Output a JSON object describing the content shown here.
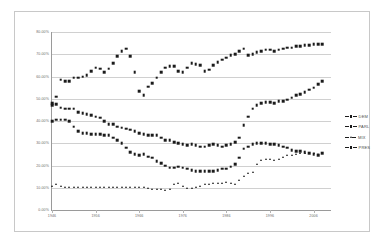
{
  "chart_data": {
    "type": "scatter",
    "title": "",
    "xlabel": "",
    "ylabel": "",
    "grid": true,
    "legend_position": "right",
    "xlim": [
      1946,
      2010
    ],
    "ylim": [
      0,
      80
    ],
    "ytick_labels": [
      "80.00%",
      "70.00%",
      "60.00%",
      "50.00%",
      "40.00%",
      "30.00%",
      "20.00%",
      "10.00%",
      "0.00%"
    ],
    "ytick_values": [
      80,
      70,
      60,
      50,
      40,
      30,
      20,
      10,
      0
    ],
    "xtick_labels": [
      "1946",
      "1956",
      "1966",
      "1976",
      "1986",
      "1996",
      "2006"
    ],
    "xtick_values": [
      1946,
      1956,
      1966,
      1976,
      1986,
      1996,
      2006
    ],
    "x": [
      1946,
      1947,
      1948,
      1949,
      1950,
      1951,
      1952,
      1953,
      1954,
      1955,
      1956,
      1957,
      1958,
      1959,
      1960,
      1961,
      1962,
      1963,
      1964,
      1965,
      1966,
      1967,
      1968,
      1969,
      1970,
      1971,
      1972,
      1973,
      1974,
      1975,
      1976,
      1977,
      1978,
      1979,
      1980,
      1981,
      1982,
      1983,
      1984,
      1985,
      1986,
      1987,
      1988,
      1989,
      1990,
      1991,
      1992,
      1993,
      1994,
      1995,
      1996,
      1997,
      1998,
      1999,
      2000,
      2001,
      2002,
      2003,
      2004,
      2005,
      2006,
      2007,
      2008
    ],
    "series": [
      {
        "name": "DEM",
        "marker": "square",
        "color": "#1b1b1b",
        "values": [
          48.0,
          51.0,
          58.5,
          58.0,
          58.0,
          59.5,
          59.5,
          60.0,
          60.5,
          62.5,
          64.0,
          63.5,
          62.0,
          63.5,
          66.0,
          69.0,
          71.5,
          72.5,
          69.0,
          62.0,
          53.5,
          51.5,
          55.5,
          57.0,
          59.5,
          62.0,
          64.0,
          64.5,
          64.5,
          62.5,
          62.0,
          64.0,
          66.0,
          65.5,
          65.0,
          62.5,
          63.0,
          65.0,
          66.5,
          67.5,
          68.5,
          69.5,
          70.0,
          71.5,
          72.5,
          69.5,
          70.0,
          71.0,
          71.5,
          72.0,
          72.0,
          71.5,
          72.0,
          72.5,
          73.0,
          73.0,
          73.5,
          73.5,
          74.0,
          74.0,
          74.5,
          74.5,
          74.5
        ]
      },
      {
        "name": "PARL",
        "marker": "square",
        "color": "#1b1b1b",
        "values": [
          47.0,
          47.5,
          46.0,
          45.5,
          45.5,
          45.5,
          44.0,
          43.5,
          43.0,
          42.5,
          42.0,
          41.5,
          40.0,
          38.5,
          38.5,
          37.5,
          37.0,
          36.5,
          36.0,
          35.5,
          34.5,
          34.0,
          33.5,
          33.5,
          33.5,
          32.5,
          31.5,
          31.5,
          30.5,
          30.0,
          29.5,
          29.0,
          29.5,
          29.0,
          28.5,
          28.5,
          29.0,
          29.5,
          29.0,
          28.5,
          29.0,
          29.5,
          30.5,
          32.5,
          38.0,
          42.0,
          45.5,
          47.0,
          48.0,
          48.5,
          48.5,
          48.0,
          49.0,
          49.0,
          49.5,
          50.5,
          51.5,
          52.0,
          53.0,
          54.0,
          55.0,
          56.5,
          58.0
        ]
      },
      {
        "name": "MIX",
        "marker": "triangle",
        "color": "#1b1b1b",
        "values": [
          11.0,
          11.5,
          11.0,
          10.5,
          10.5,
          10.5,
          10.5,
          10.5,
          10.5,
          10.5,
          10.5,
          10.5,
          10.5,
          10.5,
          10.5,
          10.5,
          10.5,
          10.5,
          10.5,
          10.5,
          10.5,
          10.5,
          10.0,
          9.5,
          9.5,
          9.5,
          9.0,
          9.5,
          11.5,
          12.0,
          11.0,
          10.0,
          10.0,
          10.5,
          11.0,
          11.5,
          11.5,
          12.0,
          12.0,
          12.0,
          12.5,
          12.0,
          11.5,
          13.5,
          15.5,
          16.5,
          17.0,
          20.5,
          22.5,
          23.0,
          23.0,
          22.5,
          23.0,
          24.0,
          24.5,
          24.5,
          25.0,
          25.5,
          25.5,
          25.5,
          25.5,
          25.0,
          25.5
        ]
      },
      {
        "name": "PRES",
        "marker": "square",
        "color": "#1b1b1b",
        "values": [
          40.0,
          40.5,
          40.5,
          40.5,
          40.0,
          37.5,
          35.5,
          34.5,
          34.5,
          34.0,
          34.0,
          34.0,
          33.5,
          33.5,
          32.5,
          31.5,
          30.0,
          28.0,
          26.0,
          25.0,
          24.5,
          25.0,
          24.0,
          23.5,
          22.0,
          21.0,
          20.0,
          19.0,
          19.0,
          19.5,
          19.0,
          18.5,
          18.0,
          17.5,
          17.5,
          17.5,
          17.5,
          17.5,
          18.0,
          18.5,
          18.5,
          19.5,
          20.5,
          23.5,
          27.5,
          28.5,
          29.5,
          30.0,
          30.0,
          30.0,
          29.5,
          29.5,
          29.0,
          28.5,
          28.0,
          27.0,
          26.5,
          26.5,
          26.0,
          25.5,
          25.0,
          24.5,
          25.5
        ]
      }
    ]
  },
  "legend": {
    "items": [
      {
        "label": "DEM"
      },
      {
        "label": "PARL"
      },
      {
        "label": "MIX"
      },
      {
        "label": "PRES"
      }
    ]
  }
}
